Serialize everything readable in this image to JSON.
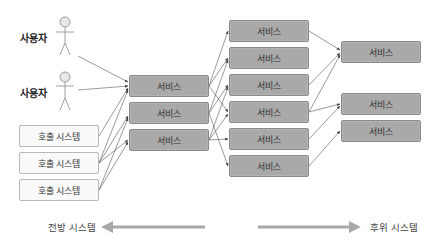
{
  "users": [
    {
      "label": "사용자"
    },
    {
      "label": "사용자"
    }
  ],
  "callers": [
    {
      "label": "호출 시스템"
    },
    {
      "label": "호출 시스템"
    },
    {
      "label": "호출 시스템"
    }
  ],
  "front_services": [
    {
      "label": "서비스"
    },
    {
      "label": "서비스"
    },
    {
      "label": "서비스"
    }
  ],
  "mid_services": [
    {
      "label": "서비스"
    },
    {
      "label": "서비스"
    },
    {
      "label": "서비스"
    },
    {
      "label": "서비스"
    },
    {
      "label": "서비스"
    },
    {
      "label": "서비스"
    }
  ],
  "back_services": [
    {
      "label": "서비스"
    },
    {
      "label": "서비스"
    },
    {
      "label": "서비스"
    }
  ],
  "legend": {
    "front_label": "전방 시스템",
    "back_label": "후위 시스템"
  },
  "colors": {
    "service_fill": "#a9a9a9",
    "caller_fill": "#fafafa",
    "arrow": "#555555",
    "direction_arrow": "#a8a8a8"
  }
}
